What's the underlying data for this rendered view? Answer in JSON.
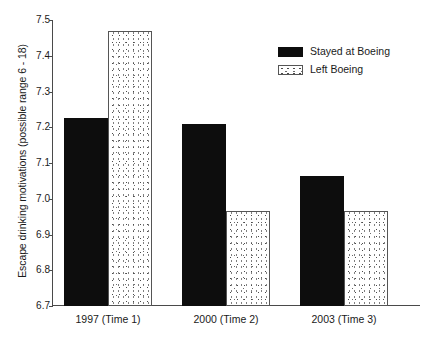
{
  "chart_data": {
    "type": "bar",
    "title": "",
    "xlabel": "",
    "ylabel": "Escape drinking motivations (possible range 6 - 18)",
    "categories": [
      "1997 (Time 1)",
      "2000 (Time 2)",
      "2003 (Time 3)"
    ],
    "series": [
      {
        "name": "Stayed at Boeing",
        "values": [
          7.225,
          7.21,
          7.065
        ],
        "fill": "solid-black",
        "color": "#0d0d0d"
      },
      {
        "name": "Left Boeing",
        "values": [
          7.47,
          6.965,
          6.965
        ],
        "fill": "stipple-white",
        "color": "#ffffff"
      }
    ],
    "ylim": [
      6.7,
      7.5
    ],
    "yticks": [
      "7.5",
      "7.4",
      "7.3",
      "7.2",
      "7.1",
      "7.0",
      "6.9",
      "6.8",
      "6.7"
    ],
    "ytick_values": [
      7.5,
      7.4,
      7.3,
      7.2,
      7.1,
      7.0,
      6.9,
      6.8,
      6.7
    ],
    "grid": false,
    "legend_position": "top-right",
    "axis_color": "#4a4a4a"
  },
  "legend": {
    "items": [
      {
        "label": "Stayed at Boeing"
      },
      {
        "label": "Left Boeing"
      }
    ]
  }
}
